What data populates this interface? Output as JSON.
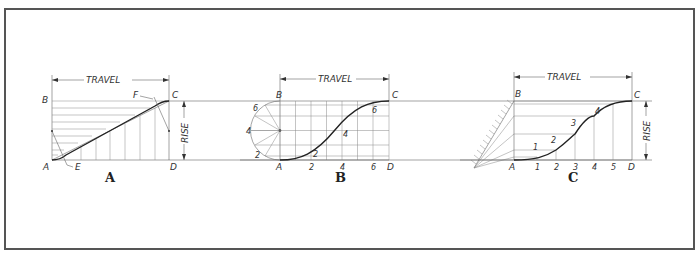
{
  "figure": {
    "dimension_labels": {
      "travel": "TRAVEL",
      "rise": "RISE"
    },
    "colors": {
      "line": "#222222",
      "construction": "#888888",
      "frame": "#555555",
      "background": "#ffffff"
    }
  },
  "diagrams": [
    {
      "id": "A",
      "caption": "A",
      "motion": "modified uniform motion",
      "points": {
        "A": "A",
        "B": "B",
        "C": "C",
        "D": "D",
        "E": "E",
        "F": "F"
      },
      "travel_label": "TRAVEL",
      "rise_label": "RISE"
    },
    {
      "id": "B",
      "caption": "B",
      "motion": "harmonic motion",
      "points": {
        "A": "A",
        "B": "B",
        "C": "C",
        "D": "D"
      },
      "circle_divisions": [
        "2",
        "4",
        "6"
      ],
      "curve_points": [
        "2",
        "4",
        "6"
      ],
      "base_ticks": [
        "2",
        "4",
        "6"
      ],
      "travel_label": "TRAVEL"
    },
    {
      "id": "C",
      "caption": "C",
      "motion": "uniformly accelerated motion",
      "points": {
        "A": "A",
        "B": "B",
        "C": "C",
        "D": "D"
      },
      "curve_points": [
        "1",
        "2",
        "3",
        "4"
      ],
      "base_ticks": [
        "1",
        "2",
        "3",
        "4",
        "5"
      ],
      "travel_label": "TRAVEL",
      "rise_label": "RISE"
    }
  ]
}
